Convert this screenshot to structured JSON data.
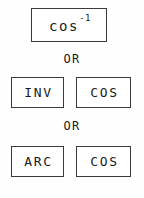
{
  "diagram": {
    "background_color": "#ffffff",
    "border_color": "#3a3a3a",
    "text_color": "#1a1a1a",
    "separator_label_1": "OR",
    "separator_label_2": "OR",
    "groups": [
      {
        "id": "group-single-key",
        "keys": [
          {
            "id": "key-cos-inverse",
            "base": "cos",
            "superscript": "-1",
            "full_text": "cos-1"
          }
        ]
      },
      {
        "id": "group-inv-cos",
        "keys": [
          {
            "id": "key-inv",
            "base": "INV",
            "superscript": "",
            "full_text": "INV"
          },
          {
            "id": "key-cos-1",
            "base": "COS",
            "superscript": "",
            "full_text": "COS"
          }
        ]
      },
      {
        "id": "group-arc-cos",
        "keys": [
          {
            "id": "key-arc",
            "base": "ARC",
            "superscript": "",
            "full_text": "ARC"
          },
          {
            "id": "key-cos-2",
            "base": "COS",
            "superscript": "",
            "full_text": "COS"
          }
        ]
      }
    ]
  }
}
